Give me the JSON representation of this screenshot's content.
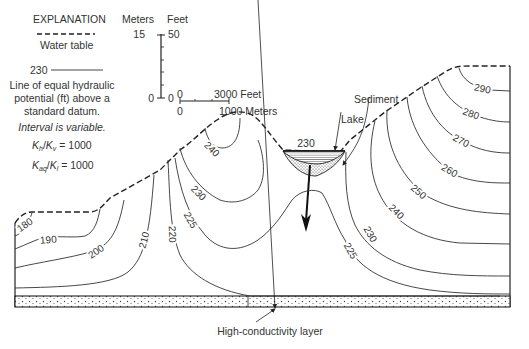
{
  "explanation": {
    "title": "EXPLANATION",
    "water_table_label": "Water table",
    "contour_sample_value": "230",
    "contour_desc_line1": "Line of equal hydraulic",
    "contour_desc_line2": "potential (ft) above a",
    "contour_desc_line3": "standard datum.",
    "interval_note": "Interval is variable.",
    "ratio1": "Kh/Kv = 1000",
    "ratio2": "Kaq/Kl = 1000"
  },
  "vertical_scale": {
    "meters_label": "Meters",
    "feet_label": "Feet",
    "meters_top": "15",
    "feet_top": "50",
    "meters_bottom": "0",
    "feet_bottom": "0"
  },
  "horizontal_scale": {
    "feet_start": "0",
    "feet_end": "3000 Feet",
    "meters_start": "0",
    "meters_end": "1000 Meters"
  },
  "annotations": {
    "lake": "Lake",
    "sediment": "Sediment",
    "lake_level": "230",
    "high_conductivity_layer": "High-conductivity layer"
  },
  "contours": {
    "c180": "180",
    "c190": "190",
    "c200": "200",
    "c210": "210",
    "c220": "220",
    "c225_left": "225",
    "c230_left": "230",
    "c240_left": "240",
    "c225_right": "225",
    "c230_right": "230",
    "c240_right": "240",
    "c250": "250",
    "c260": "260",
    "c270": "270",
    "c280": "280",
    "c290": "290"
  }
}
